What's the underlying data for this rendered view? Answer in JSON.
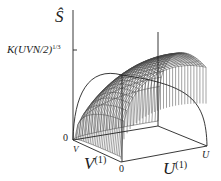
{
  "diagram": {
    "type": "3d-surface-plot",
    "axes": {
      "vertical": {
        "label": "Ŝ",
        "tick_label": "K(UVN/2)",
        "tick_exponent": "1/3",
        "origin_label": "0"
      },
      "v_axis": {
        "label": "V",
        "label_superscript": "(1)",
        "end_label": "V"
      },
      "u_axis": {
        "label": "U",
        "label_superscript": "(1)",
        "origin_label": "0",
        "end_label": "U"
      }
    },
    "colors": {
      "lines": "#222222",
      "mesh": "#555555",
      "background": "#ffffff"
    }
  }
}
